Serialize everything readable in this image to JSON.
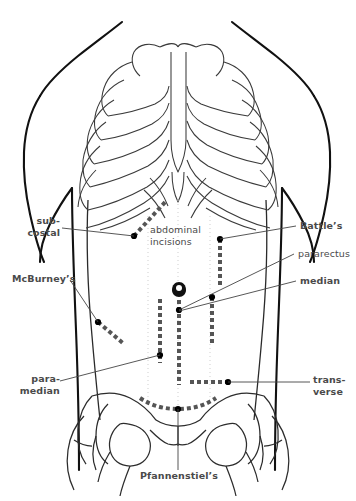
{
  "figure": {
    "title_line1": "abdominal",
    "title_line2": "incisions",
    "colors": {
      "background": "#ffffff",
      "outline": "#000000",
      "bone": "#3a3a3a",
      "label_text": "#4a4a4a",
      "incision": "#555555",
      "leader_line": "#444444",
      "marker_dot": "#000000"
    }
  },
  "labels": {
    "subcostal": {
      "line1": "sub-",
      "line2": "costal",
      "bold": true
    },
    "mcburneys": {
      "line1": "McBurney’s",
      "bold": true
    },
    "paramedian": {
      "line1": "para-",
      "line2": "median",
      "bold": true
    },
    "pfannenstiels": {
      "line1": "Pfannenstiel’s",
      "bold": true
    },
    "battles": {
      "line1": "Battle’s",
      "bold": true
    },
    "pararectus": {
      "line1": "pararectus",
      "bold": false
    },
    "median": {
      "line1": "median",
      "bold": true
    },
    "transverse": {
      "line1": "trans-",
      "line2": "verse",
      "bold": true
    }
  },
  "incisions": [
    {
      "name": "subcostal",
      "orientation": "oblique",
      "side": "left"
    },
    {
      "name": "mcburneys",
      "orientation": "oblique",
      "side": "left"
    },
    {
      "name": "paramedian",
      "orientation": "vertical",
      "side": "left"
    },
    {
      "name": "median",
      "orientation": "vertical",
      "side": "midline"
    },
    {
      "name": "pararectus",
      "orientation": "vertical",
      "side": "right"
    },
    {
      "name": "battles",
      "orientation": "vertical",
      "side": "right"
    },
    {
      "name": "transverse",
      "orientation": "horizontal",
      "side": "lower"
    },
    {
      "name": "pfannenstiels",
      "orientation": "curved",
      "side": "suprapubic"
    }
  ]
}
